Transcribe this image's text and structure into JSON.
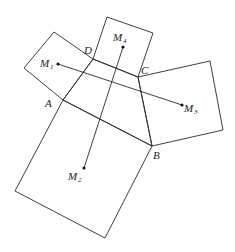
{
  "diagram": {
    "type": "geometry",
    "quadrilateral": {
      "vertices": [
        {
          "name": "A",
          "x": 63,
          "y": 100,
          "label_x": 45,
          "label_y": 107
        },
        {
          "name": "B",
          "x": 152,
          "y": 146,
          "label_x": 153,
          "label_y": 159
        },
        {
          "name": "C",
          "x": 138,
          "y": 77,
          "label_x": 141,
          "label_y": 74
        },
        {
          "name": "D",
          "x": 93,
          "y": 59,
          "label_x": 84,
          "label_y": 54
        }
      ]
    },
    "squares": [
      {
        "name": "square-on-DA",
        "points": "93,59 54,32 24,68 63,100"
      },
      {
        "name": "square-on-CD",
        "points": "138,77 153,33 107,17 93,59"
      },
      {
        "name": "square-on-BC",
        "points": "152,146 223,130 210,61 138,77"
      },
      {
        "name": "square-on-AB",
        "points": "63,100 15,191 105,238 152,146"
      }
    ],
    "centers": [
      {
        "name": "M",
        "sub": "1",
        "x": 58,
        "y": 64,
        "label_x": 40,
        "label_y": 67,
        "sub_x": 50,
        "sub_y": 69
      },
      {
        "name": "M",
        "sub": "2",
        "x": 84,
        "y": 168,
        "label_x": 68,
        "label_y": 180,
        "sub_x": 78,
        "sub_y": 182
      },
      {
        "name": "M",
        "sub": "3",
        "x": 182,
        "y": 105,
        "label_x": 184,
        "label_y": 112,
        "sub_x": 194,
        "sub_y": 114
      },
      {
        "name": "M",
        "sub": "4",
        "x": 123,
        "y": 47,
        "label_x": 113,
        "label_y": 41,
        "sub_x": 123,
        "sub_y": 43
      }
    ],
    "segments": [
      {
        "name": "M1-M3",
        "from": "M1",
        "to": "M3",
        "x1": 58,
        "y1": 64,
        "x2": 182,
        "y2": 105
      },
      {
        "name": "M2-M4",
        "from": "M2",
        "to": "M4",
        "x1": 84,
        "y1": 168,
        "x2": 123,
        "y2": 47
      }
    ]
  }
}
